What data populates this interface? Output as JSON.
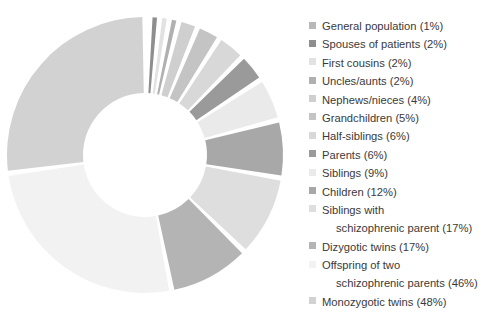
{
  "chart_data": {
    "type": "pie",
    "variant": "donut",
    "title": "",
    "subtitle": "",
    "xlabel": "",
    "ylabel": "",
    "legend_position": "right",
    "grid": false,
    "start_angle_deg": 0,
    "direction": "clockwise",
    "value_unit": "%",
    "categories": [
      "General population",
      "Spouses of patients",
      "First cousins",
      "Uncles/aunts",
      "Nephews/nieces",
      "Grandchildren",
      "Half-siblings",
      "Parents",
      "Siblings",
      "Children",
      "Siblings with schizophrenic parent",
      "Dizygotic twins",
      "Offspring of two schizophrenic parents",
      "Monozygotic twins"
    ],
    "values": [
      1,
      2,
      2,
      2,
      4,
      5,
      6,
      6,
      9,
      12,
      17,
      17,
      46,
      48
    ],
    "colors": [
      "#b8b8b8",
      "#8e8e8e",
      "#e2e2e2",
      "#b0b0b0",
      "#cfcfcf",
      "#c4c4c4",
      "#d8d8d8",
      "#9a9a9a",
      "#eaeaea",
      "#a8a8a8",
      "#dedede",
      "#b4b4b4",
      "#f2f2f2",
      "#d2d2d2"
    ]
  },
  "legend": {
    "entries": [
      {
        "label": "General population (1%)",
        "color": "#b8b8b8",
        "indented": false,
        "has_swatch": true
      },
      {
        "label": "Spouses of patients (2%)",
        "color": "#8e8e8e",
        "indented": false,
        "has_swatch": true
      },
      {
        "label": "First cousins (2%)",
        "color": "#e2e2e2",
        "indented": false,
        "has_swatch": true
      },
      {
        "label": "Uncles/aunts (2%)",
        "color": "#b0b0b0",
        "indented": false,
        "has_swatch": true
      },
      {
        "label": "Nephews/nieces (4%)",
        "color": "#cfcfcf",
        "indented": false,
        "has_swatch": true
      },
      {
        "label": "Grandchildren (5%)",
        "color": "#c4c4c4",
        "indented": false,
        "has_swatch": true
      },
      {
        "label": "Half-siblings (6%)",
        "color": "#d8d8d8",
        "indented": false,
        "has_swatch": true
      },
      {
        "label": "Parents (6%)",
        "color": "#9a9a9a",
        "indented": false,
        "has_swatch": true
      },
      {
        "label": "Siblings (9%)",
        "color": "#eaeaea",
        "indented": false,
        "has_swatch": true
      },
      {
        "label": "Children (12%)",
        "color": "#a8a8a8",
        "indented": false,
        "has_swatch": true
      },
      {
        "label": "Siblings with",
        "color": "#dedede",
        "indented": false,
        "has_swatch": true
      },
      {
        "label": "schizophrenic parent (17%)",
        "color": "",
        "indented": true,
        "has_swatch": false
      },
      {
        "label": "Dizygotic twins (17%)",
        "color": "#b4b4b4",
        "indented": false,
        "has_swatch": true
      },
      {
        "label": "Offspring of two",
        "color": "#f2f2f2",
        "indented": false,
        "has_swatch": true
      },
      {
        "label": "schizophrenic parents (46%)",
        "color": "",
        "indented": true,
        "has_swatch": false
      },
      {
        "label": "Monozygotic twins (48%)",
        "color": "#d2d2d2",
        "indented": false,
        "has_swatch": true
      }
    ]
  }
}
